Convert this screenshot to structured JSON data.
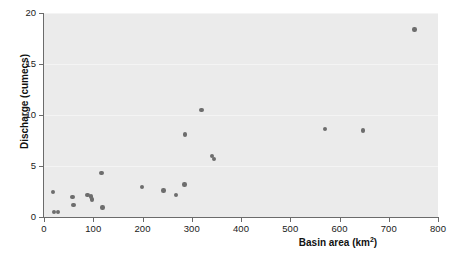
{
  "chart_data": {
    "type": "scatter",
    "title": "",
    "xlabel": "Basin area (km2)",
    "xlabel_base": "Basin area (km",
    "xlabel_sup": "2",
    "xlabel_tail": ")",
    "ylabel": "Discharge (cumecs)",
    "xlim": [
      0,
      800
    ],
    "ylim": [
      0,
      20
    ],
    "xticks": [
      0,
      100,
      200,
      300,
      400,
      500,
      600,
      700,
      800
    ],
    "yticks": [
      0,
      5,
      10,
      15,
      20
    ],
    "xtick_labels": [
      "0",
      "100",
      "200",
      "300",
      "400",
      "500",
      "600",
      "700",
      "800"
    ],
    "ytick_labels": [
      "0",
      "5",
      "10",
      "15",
      "20"
    ],
    "grid": true,
    "grid_axis": "y",
    "legend": false,
    "marker_color": "#6d6d6d",
    "panel_color": "#ebebeb",
    "points": [
      {
        "x": 18,
        "y": 2.45
      },
      {
        "x": 20,
        "y": 0.5
      },
      {
        "x": 28,
        "y": 0.5
      },
      {
        "x": 58,
        "y": 1.95
      },
      {
        "x": 60,
        "y": 1.2
      },
      {
        "x": 88,
        "y": 2.15
      },
      {
        "x": 96,
        "y": 2.0
      },
      {
        "x": 98,
        "y": 1.7
      },
      {
        "x": 117,
        "y": 4.3
      },
      {
        "x": 119,
        "y": 0.95
      },
      {
        "x": 199,
        "y": 2.95
      },
      {
        "x": 243,
        "y": 2.6
      },
      {
        "x": 268,
        "y": 2.15
      },
      {
        "x": 285,
        "y": 3.2
      },
      {
        "x": 286,
        "y": 8.1
      },
      {
        "x": 320,
        "y": 10.5
      },
      {
        "x": 341,
        "y": 6.0
      },
      {
        "x": 345,
        "y": 5.7
      },
      {
        "x": 570,
        "y": 8.6
      },
      {
        "x": 648,
        "y": 8.5
      },
      {
        "x": 752,
        "y": 18.4
      }
    ]
  }
}
